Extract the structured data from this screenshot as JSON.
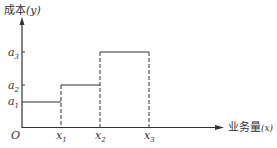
{
  "diagram": {
    "type": "step cost function",
    "y_axis_label": "成本",
    "y_axis_var": "(y)",
    "x_axis_label": "业务量",
    "x_axis_var": "(x)",
    "origin_label": "O",
    "y_ticks": [
      {
        "base": "a",
        "sub": "1"
      },
      {
        "base": "a",
        "sub": "2"
      },
      {
        "base": "a",
        "sub": "3"
      }
    ],
    "x_ticks": [
      {
        "base": "x",
        "sub": "1"
      },
      {
        "base": "x",
        "sub": "2"
      },
      {
        "base": "x",
        "sub": "3"
      }
    ],
    "steps": [
      {
        "from": "0",
        "to": "x1",
        "level": "a1"
      },
      {
        "from": "x1",
        "to": "x2",
        "level": "a2"
      },
      {
        "from": "x2",
        "to": "x3",
        "level": "a3"
      }
    ]
  }
}
